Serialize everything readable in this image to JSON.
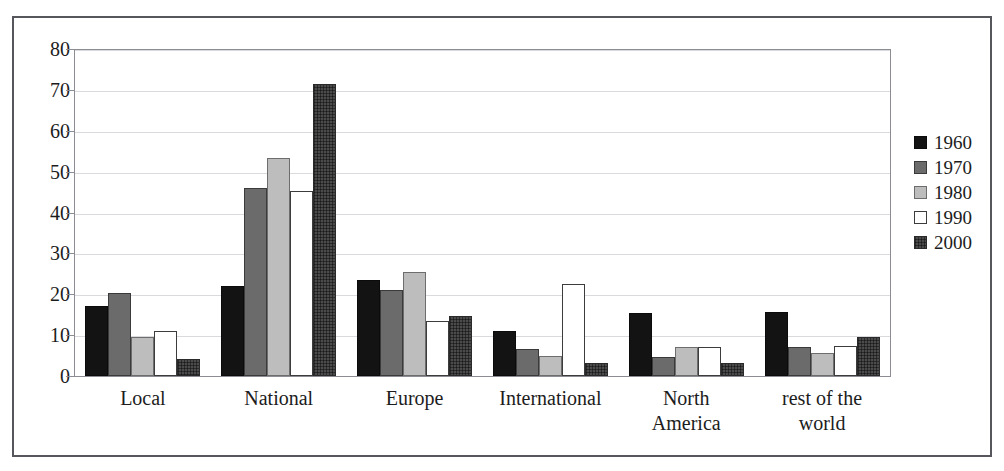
{
  "chart_data": {
    "type": "bar",
    "title": "",
    "subtitle": "",
    "xlabel": "",
    "ylabel": "",
    "ylim": [
      0,
      80
    ],
    "yticks": [
      0,
      10,
      20,
      30,
      40,
      50,
      60,
      70,
      80
    ],
    "grid": true,
    "legend_position": "right",
    "categories": [
      "Local",
      "National",
      "Europe",
      "International",
      "North America",
      "rest of the world"
    ],
    "category_lines": [
      [
        "Local"
      ],
      [
        "National"
      ],
      [
        "Europe"
      ],
      [
        "International"
      ],
      [
        "North",
        "America"
      ],
      [
        "rest of the",
        "world"
      ]
    ],
    "series": [
      {
        "name": "1960",
        "color": "#131313",
        "values": [
          17.2,
          22.0,
          23.5,
          11.0,
          15.5,
          15.6
        ]
      },
      {
        "name": "1970",
        "color": "#6b6b6b",
        "values": [
          20.4,
          46.0,
          21.0,
          6.5,
          4.7,
          7.2
        ]
      },
      {
        "name": "1980",
        "color": "#bdbdbd",
        "values": [
          9.6,
          53.3,
          25.5,
          5.0,
          7.0,
          5.6
        ]
      },
      {
        "name": "1990",
        "color": "#ffffff",
        "values": [
          11.0,
          45.3,
          13.5,
          22.5,
          7.0,
          7.4
        ]
      },
      {
        "name": "2000",
        "color": "#4b4b4b",
        "values": [
          4.2,
          71.5,
          14.6,
          3.2,
          3.3,
          9.6
        ]
      }
    ]
  },
  "legend": {
    "entries": [
      {
        "label": "1960"
      },
      {
        "label": "1970"
      },
      {
        "label": "1980"
      },
      {
        "label": "1990"
      },
      {
        "label": "2000"
      }
    ]
  },
  "axis": {
    "y_tick_labels": [
      "80",
      "70",
      "60",
      "50",
      "40",
      "30",
      "20",
      "10",
      "0"
    ]
  }
}
